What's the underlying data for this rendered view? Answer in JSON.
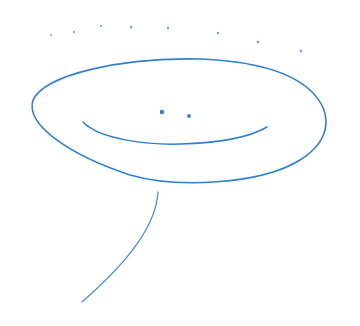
{
  "drawing": {
    "subject": "hand-drawn smiling ellipse face with a tail line",
    "stroke_color": "#2f80d0",
    "background": "#ffffff",
    "elements": {
      "dots_row": "curved row of small dots above the face",
      "face": "large ellipse outline",
      "eyes": "two small dots",
      "mouth": "smile curve",
      "tail": "curved line extending down-left from bottom of ellipse"
    }
  }
}
